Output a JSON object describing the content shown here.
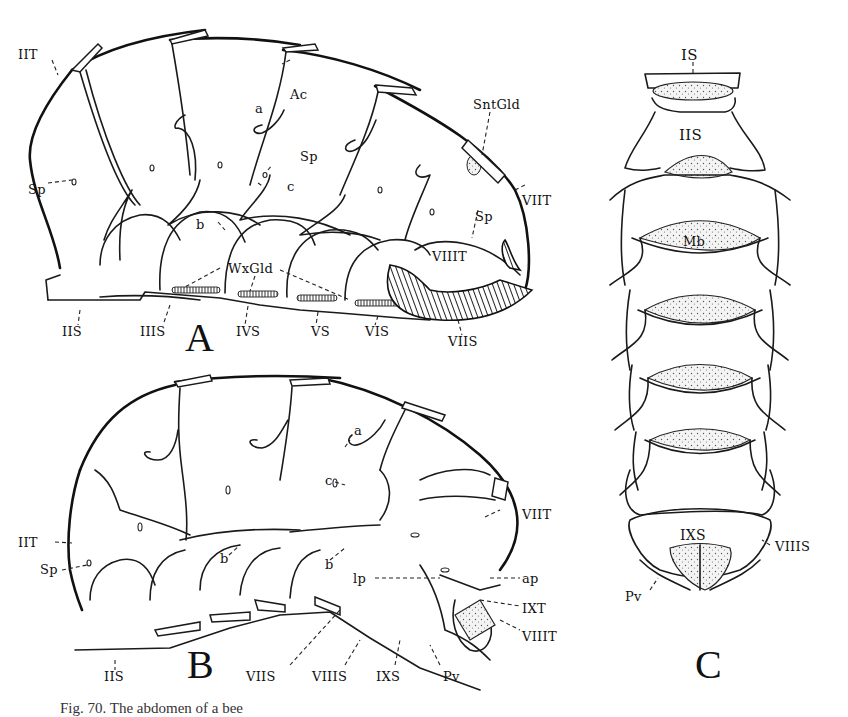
{
  "figure": {
    "panels": [
      {
        "id": "A",
        "letter": "A",
        "view": "lateral, female abdomen",
        "labels": {
          "IIT": "IIT",
          "Sp1": "Sp",
          "Ac": "Ac",
          "a": "a",
          "Sp2": "Sp",
          "c": "c",
          "b": "b",
          "SntGld": "SntGld",
          "VIIT": "VIIT",
          "Sp3": "Sp",
          "VIIIT": "VIIIT",
          "WxGld": "WxGld",
          "IIS": "IIS",
          "IIIS": "IIIS",
          "IVS": "IVS",
          "VS": "VS",
          "VIS": "VIS",
          "VIIS": "VIIS"
        }
      },
      {
        "id": "B",
        "letter": "B",
        "view": "lateral, male abdomen",
        "labels": {
          "IIT": "IIT",
          "Sp": "Sp",
          "b1": "b",
          "b2": "b",
          "a": "a",
          "c": "c",
          "VIIT": "VIIT",
          "lp": "lp",
          "ap": "ap",
          "IXT": "IXT",
          "VIIIT": "VIIIT",
          "IIS": "IIS",
          "VIIS": "VIIS",
          "VIIIS": "VIIIS",
          "IXS": "IXS",
          "Pv": "Pv"
        }
      },
      {
        "id": "C",
        "letter": "C",
        "view": "ventral",
        "labels": {
          "IS": "IS",
          "IIS": "IIS",
          "Mb": "Mb",
          "IXS": "IXS",
          "VIIIS": "VIIIS",
          "Pv": "Pv"
        }
      }
    ],
    "caption_fragment": "Fig. 70. The abdomen of a bee"
  }
}
